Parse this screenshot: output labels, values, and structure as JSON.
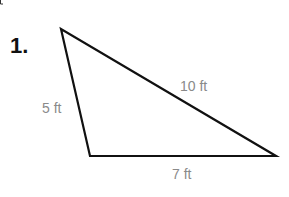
{
  "problem": {
    "number": "1.",
    "figure": "triangle",
    "sides": {
      "left": "5 ft",
      "hypotenuse": "10 ft",
      "base": "7 ft"
    }
  },
  "colors": {
    "stroke": "#111111",
    "label": "#8a8a8a"
  }
}
